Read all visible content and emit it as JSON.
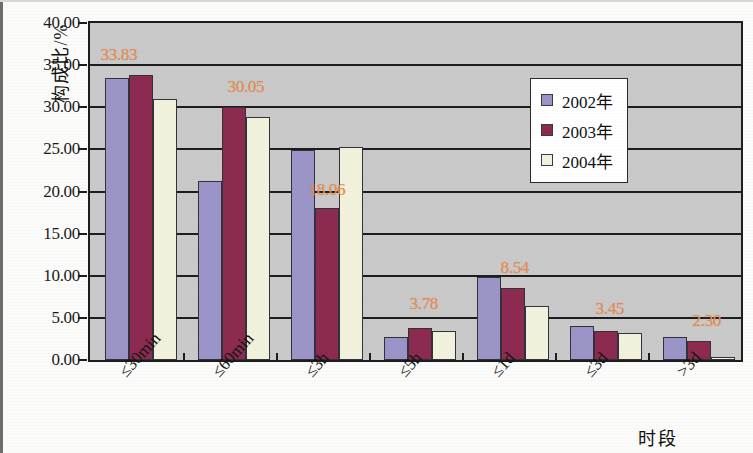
{
  "chart_data": {
    "type": "bar",
    "title": "",
    "xlabel": "时段",
    "ylabel": "构成比/%",
    "ylim": [
      0,
      40
    ],
    "ytick_step": 5,
    "ytick_labels": [
      "0.00",
      "5.00",
      "10.00",
      "15.00",
      "20.00",
      "25.00",
      "30.00",
      "35.00",
      "40.00"
    ],
    "grid": true,
    "legend_position": "top-right",
    "categories": [
      "≤30min",
      "≤60min",
      "≤3h",
      "≤5h",
      "≤1d",
      "≤3d",
      ">3d"
    ],
    "series": [
      {
        "name": "2002年",
        "color": "#9a95c6",
        "values": [
          33.5,
          21.2,
          24.9,
          2.7,
          9.9,
          4.0,
          2.75
        ]
      },
      {
        "name": "2003年",
        "color": "#8d2a4f",
        "values": [
          33.83,
          30.05,
          18.06,
          3.78,
          8.54,
          3.45,
          2.3
        ]
      },
      {
        "name": "2004年",
        "color": "#f2f2dc",
        "values": [
          31.0,
          28.9,
          25.3,
          3.5,
          6.4,
          3.2,
          0.4
        ]
      }
    ],
    "annotations": [
      {
        "text": "33.83",
        "category": "≤30min",
        "value": 33.83
      },
      {
        "text": "30.05",
        "category": "≤60min",
        "value": 30.05
      },
      {
        "text": "18.06",
        "category": "≤3h",
        "value": 18.06
      },
      {
        "text": "3.78",
        "category": "≤5h",
        "value": 3.78
      },
      {
        "text": "8.54",
        "category": "≤1d",
        "value": 8.54
      },
      {
        "text": "3.45",
        "category": "≤3d",
        "value": 3.45
      },
      {
        "text": "2.30",
        "category": ">3d",
        "value": 2.3
      }
    ],
    "annotation_color": "#e08c54",
    "plot_background": "#c9c9c9",
    "axis_color": "#1d1d1d"
  },
  "legend": {
    "items": [
      {
        "label": "2002年"
      },
      {
        "label": "2003年"
      },
      {
        "label": "2004年"
      }
    ]
  }
}
